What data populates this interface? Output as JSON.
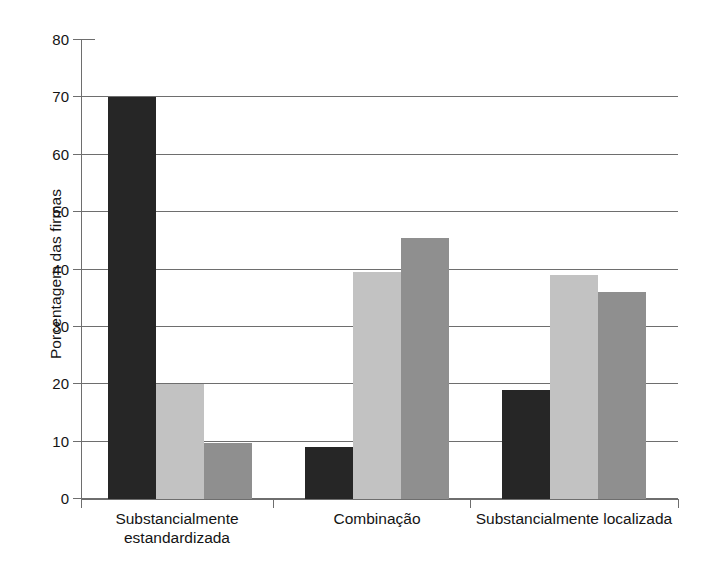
{
  "chart_data": {
    "type": "bar",
    "title": "",
    "xlabel": "",
    "ylabel": "Porcentagem das firmas",
    "ylim": [
      0,
      80
    ],
    "ytick_labels": [
      "0",
      "10",
      "20",
      "30",
      "40",
      "50",
      "60",
      "70",
      "80"
    ],
    "ytick_values": [
      0,
      10,
      20,
      30,
      40,
      50,
      60,
      70,
      80
    ],
    "grid": true,
    "legend": "none",
    "categories": [
      "Substancialmente estandardizada",
      "Combinação",
      "Substancialmente localizada"
    ],
    "category_lines": [
      [
        "Substancialmente",
        "estandardizada"
      ],
      [
        "Combinação"
      ],
      [
        "Substancialmente localizada"
      ]
    ],
    "series": [
      {
        "name": "series-1",
        "color": "#262626",
        "values": [
          70,
          9,
          19
        ]
      },
      {
        "name": "series-2",
        "color": "#c2c2c2",
        "values": [
          20,
          39.5,
          39
        ]
      },
      {
        "name": "series-3",
        "color": "#8f8f8f",
        "values": [
          9.7,
          45.5,
          36
        ]
      }
    ]
  },
  "colors": {
    "background": "#ffffff",
    "axis": "#6e6e6e",
    "grid": "#6e6e6e",
    "text": "#141414",
    "series_dark": "#262626",
    "series_light": "#c2c2c2",
    "series_medium": "#8f8f8f"
  }
}
